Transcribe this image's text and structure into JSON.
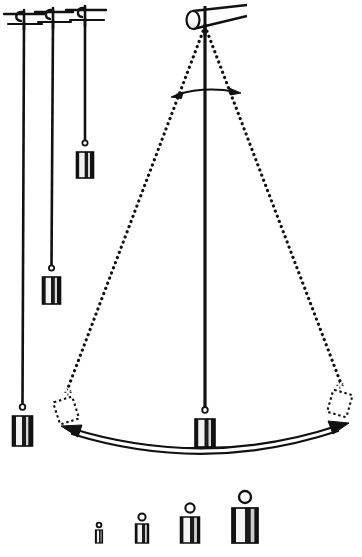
{
  "figure": {
    "background_color": "#ffffff",
    "ink_color": "#111111"
  },
  "supports": [
    {
      "name": "support-bar-1",
      "x": 24,
      "y": 18,
      "half_width": 20,
      "hook_label": "hook"
    },
    {
      "name": "support-bar-2",
      "x": 53,
      "y": 16,
      "half_width": 19,
      "hook_label": "hook"
    },
    {
      "name": "support-bar-3",
      "x": 85,
      "y": 14,
      "half_width": 20,
      "hook_label": "hook"
    }
  ],
  "pendulums": [
    {
      "name": "pendulum-long",
      "label": "longest pendulum",
      "pivot_x": 24,
      "pivot_y": 22,
      "bob_x": 22,
      "bob_y": 416,
      "string_length": 394,
      "bob_width": 20,
      "bob_height": 30,
      "state": "at rest"
    },
    {
      "name": "pendulum-medium",
      "label": "medium pendulum",
      "pivot_x": 53,
      "pivot_y": 20,
      "bob_x": 51,
      "bob_y": 277,
      "string_length": 257,
      "bob_width": 18,
      "bob_height": 27,
      "state": "at rest"
    },
    {
      "name": "pendulum-short",
      "label": "shortest pendulum",
      "pivot_x": 85,
      "pivot_y": 18,
      "bob_x": 85,
      "bob_y": 152,
      "string_length": 134,
      "bob_width": 17,
      "bob_height": 26,
      "state": "at rest"
    }
  ],
  "swinging_pendulum": {
    "name": "pendulum-swinging",
    "label": "swinging pendulum",
    "pivot_x": 205,
    "pivot_y": 24,
    "rest_bob_x": 205,
    "rest_bob_y": 419,
    "left_extreme_bob_x": 66,
    "left_extreme_bob_y": 399,
    "right_extreme_bob_x": 339,
    "right_extreme_bob_y": 392,
    "string_length": 395,
    "bob_width": 20,
    "bob_height": 28,
    "state": "swinging",
    "extreme_positions_style": "dotted outline"
  },
  "pivot_rod": {
    "name": "pivot-rod",
    "label": "cylindrical support rod",
    "cylinder_x": 192,
    "cylinder_y": 20,
    "cylinder_rx": 7,
    "cylinder_ry": 9,
    "bar_end_x": 248,
    "bar_end_y": 10
  },
  "angle_arc": {
    "name": "swing-angle-arc",
    "label": "swing angle indicator",
    "left_x": 172,
    "right_x": 238,
    "y": 93,
    "arrowheads": "both ends",
    "value_text": ""
  },
  "swing_arc": {
    "name": "swing-path-arc",
    "label": "swing path double headed arrow",
    "left_x": 63,
    "left_y": 427,
    "right_x": 344,
    "right_y": 424,
    "mid_x": 205,
    "mid_y": 449,
    "arrowheads": "both ends",
    "style": "outlined double line"
  },
  "weights": [
    {
      "name": "weight-1",
      "label": "smallest weight",
      "x": 99,
      "y": 532,
      "width": 7,
      "height": 12,
      "ring_r": 2.4
    },
    {
      "name": "weight-2",
      "label": "small weight",
      "x": 142,
      "y": 528,
      "width": 13,
      "height": 19,
      "ring_r": 3.6
    },
    {
      "name": "weight-3",
      "label": "medium weight",
      "x": 190,
      "y": 524,
      "width": 19,
      "height": 26,
      "ring_r": 4.6
    },
    {
      "name": "weight-4",
      "label": "largest weight",
      "x": 245,
      "y": 518,
      "width": 26,
      "height": 34,
      "ring_r": 6.0
    }
  ]
}
